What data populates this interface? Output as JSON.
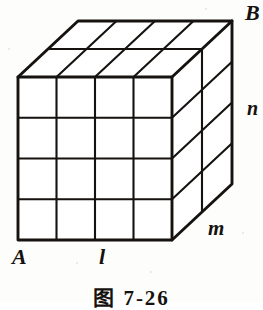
{
  "figure": {
    "caption": "图 7-26",
    "line_color": "#15120f",
    "face_color": "#ffffff",
    "background_color": "#fdfdfb"
  },
  "labels": {
    "vertex_a": "A",
    "vertex_b": "B",
    "edge_length": "l",
    "edge_depth": "m",
    "edge_height": "n"
  },
  "geometry": {
    "divisions_length": 4,
    "divisions_height": 4,
    "divisions_depth": 2,
    "front_top_left": {
      "x": 18,
      "y": 77
    },
    "front_bottom_left": {
      "x": 18,
      "y": 240
    },
    "front_bottom_right": {
      "x": 172,
      "y": 240
    },
    "front_top_right": {
      "x": 172,
      "y": 77
    },
    "depth_offset": {
      "x": 60,
      "y": -56
    }
  }
}
